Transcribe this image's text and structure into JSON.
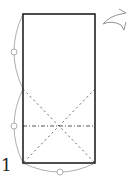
{
  "diagram": {
    "type": "origami-step",
    "step_number": "1",
    "elements": {
      "paper_rectangle": {
        "x": 23,
        "y": 14,
        "width": 72,
        "height": 149,
        "stroke": "#222222"
      },
      "valley_fold_diagonals": [
        {
          "from": [
            23,
            89
          ],
          "to": [
            95,
            163
          ]
        },
        {
          "from": [
            95,
            89
          ],
          "to": [
            23,
            163
          ]
        }
      ],
      "mountain_fold_horizontal": {
        "from": [
          23,
          126
        ],
        "to": [
          95,
          126
        ]
      },
      "equal_length_arcs": [
        {
          "name": "left-upper-arc",
          "marker": [
            14,
            52
          ]
        },
        {
          "name": "left-lower-arc",
          "marker": [
            14,
            126
          ]
        },
        {
          "name": "bottom-arc",
          "marker": [
            60,
            172
          ]
        }
      ],
      "turn_over_arrow": {
        "position": [
          104,
          8
        ],
        "meaning": "turn over"
      }
    },
    "colors": {
      "line": "#222222",
      "fold_line": "#555555",
      "arc": "#888888"
    }
  }
}
